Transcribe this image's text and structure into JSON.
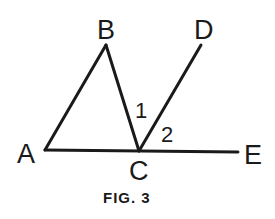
{
  "figure": {
    "caption": "FIG. 3",
    "stroke_color": "#1a1a1a",
    "background": "#ffffff",
    "points": {
      "A": {
        "label": "A",
        "x": 45,
        "y": 150
      },
      "B": {
        "label": "B",
        "x": 106,
        "y": 45
      },
      "C": {
        "label": "C",
        "x": 139,
        "y": 151
      },
      "D": {
        "label": "D",
        "x": 201,
        "y": 45
      },
      "E": {
        "label": "E",
        "x": 238,
        "y": 152
      }
    },
    "segments": [
      "AB",
      "BC",
      "AE",
      "CD"
    ],
    "angles": [
      {
        "label": "1",
        "between": "BC and CD"
      },
      {
        "label": "2",
        "between": "CD and CE"
      }
    ]
  }
}
